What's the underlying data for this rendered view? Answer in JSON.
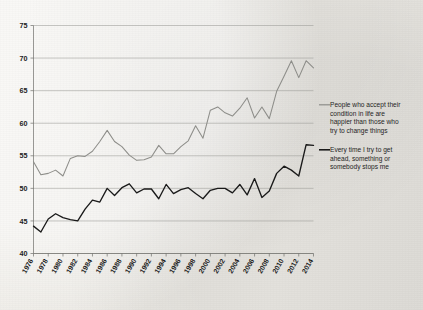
{
  "chart_data": {
    "type": "line",
    "title": "",
    "xlabel": "",
    "ylabel": "",
    "ylim": [
      40,
      75
    ],
    "xlim": [
      1976,
      2014
    ],
    "ytick_values": [
      40,
      45,
      50,
      55,
      60,
      65,
      70,
      75
    ],
    "ytick_labels": [
      "40",
      "45",
      "50",
      "55",
      "60",
      "65",
      "70",
      "75"
    ],
    "xtick_labels": [
      "1976",
      "1978",
      "1980",
      "1982",
      "1984",
      "1986",
      "1988",
      "1990",
      "1992",
      "1994",
      "1996",
      "1998",
      "2000",
      "2002",
      "2004",
      "2006",
      "2008",
      "2010",
      "2012",
      "2014"
    ],
    "grid": true,
    "legend_position": "right",
    "x": [
      1976,
      1977,
      1978,
      1979,
      1980,
      1981,
      1982,
      1983,
      1984,
      1985,
      1986,
      1987,
      1988,
      1989,
      1990,
      1991,
      1992,
      1993,
      1994,
      1995,
      1996,
      1997,
      1998,
      1999,
      2000,
      2001,
      2002,
      2003,
      2004,
      2005,
      2006,
      2007,
      2008,
      2009,
      2010,
      2011,
      2012,
      2013,
      2014
    ],
    "series": [
      {
        "name": "People who accept their condition in life are happier than those who try to change things",
        "color": "#8d8d89",
        "values": [
          54.1,
          52.1,
          52.3,
          52.8,
          51.9,
          54.6,
          55.0,
          54.9,
          55.7,
          57.2,
          58.9,
          57.2,
          56.4,
          55.1,
          54.3,
          54.4,
          54.8,
          56.6,
          55.3,
          55.3,
          56.4,
          57.3,
          59.6,
          57.7,
          62.0,
          62.5,
          61.6,
          61.1,
          62.3,
          63.9,
          60.8,
          62.5,
          60.7,
          64.9,
          67.2,
          69.6,
          67.0,
          69.6,
          68.5
        ]
      },
      {
        "name": "Every time I try to get ahead, something or somebody stops me",
        "color": "#1a1a1a",
        "values": [
          44.2,
          43.3,
          45.3,
          46.1,
          45.5,
          45.2,
          45.0,
          46.8,
          48.2,
          47.9,
          50.0,
          48.9,
          50.1,
          50.7,
          49.3,
          49.9,
          49.9,
          48.4,
          50.6,
          49.2,
          49.8,
          50.1,
          49.2,
          48.4,
          49.7,
          50.0,
          50.0,
          49.3,
          50.6,
          49.0,
          51.5,
          48.6,
          49.6,
          52.3,
          53.4,
          52.8,
          51.9,
          56.7,
          56.6
        ]
      }
    ],
    "legend": [
      {
        "label_lines": [
          "People who accept their",
          "condition in life are",
          "happier than those who",
          "try to change things"
        ],
        "color": "#8d8d89"
      },
      {
        "label_lines": [
          "Every time I try to get",
          "ahead, something or",
          "somebody stops me"
        ],
        "color": "#1a1a1a"
      }
    ]
  }
}
